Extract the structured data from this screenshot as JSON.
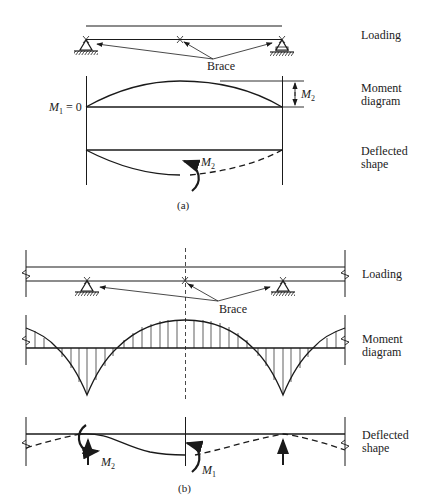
{
  "figure_a": {
    "caption": "(a)",
    "labels": {
      "loading": "Loading",
      "moment_line1": "Moment",
      "moment_line2": "diagram",
      "deflected_line1": "Deflected",
      "deflected_line2": "shape",
      "brace": "Brace"
    },
    "annotations": {
      "m1_symbol": "M",
      "m1_sub": "1",
      "m1_eq": " = 0",
      "m2_symbol": "M",
      "m2_sub": "2",
      "m2_deflected_symbol": "M",
      "m2_deflected_sub": "2"
    }
  },
  "figure_b": {
    "caption": "(b)",
    "labels": {
      "loading": "Loading",
      "moment_line1": "Moment",
      "moment_line2": "diagram",
      "deflected_line1": "Deflected",
      "deflected_line2": "shape",
      "brace": "Brace"
    },
    "annotations": {
      "m2_symbol": "M",
      "m2_sub": "2",
      "m1_symbol": "M",
      "m1_sub": "1"
    }
  },
  "colors": {
    "ink": "#1a1a1a",
    "background": "#ffffff"
  }
}
